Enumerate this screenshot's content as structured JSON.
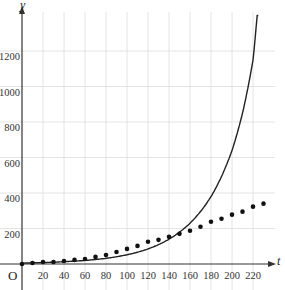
{
  "chart_data": {
    "type": "scatter",
    "title": "",
    "xlabel": "t",
    "ylabel": "y",
    "origin_label": "O",
    "xlim": [
      0,
      240
    ],
    "ylim": [
      0,
      1400
    ],
    "grid": true,
    "x_ticks": [
      20,
      40,
      60,
      80,
      100,
      120,
      140,
      160,
      180,
      200,
      220
    ],
    "y_ticks": [
      200,
      400,
      600,
      800,
      1000,
      1200
    ],
    "series": [
      {
        "name": "data points",
        "kind": "scatter",
        "x": [
          0,
          10,
          20,
          30,
          40,
          50,
          60,
          70,
          80,
          90,
          100,
          110,
          120,
          130,
          140,
          150,
          160,
          170,
          180,
          190,
          200,
          210,
          220,
          230
        ],
        "y": [
          0,
          6,
          11,
          11,
          17,
          23,
          28,
          40,
          51,
          68,
          85,
          102,
          125,
          136,
          153,
          170,
          187,
          210,
          238,
          255,
          278,
          295,
          323,
          340
        ]
      },
      {
        "name": "exponential model",
        "kind": "line",
        "x": [
          0,
          20,
          40,
          60,
          80,
          100,
          120,
          140,
          160,
          180,
          200,
          210,
          220,
          224
        ],
        "y": [
          5,
          8,
          13,
          20,
          32,
          52,
          85,
          140,
          230,
          380,
          640,
          850,
          1150,
          1400
        ]
      }
    ],
    "colors": {
      "curve": "#222222",
      "points": "#111111",
      "grid": "#dddddd",
      "axis": "#333333"
    }
  }
}
